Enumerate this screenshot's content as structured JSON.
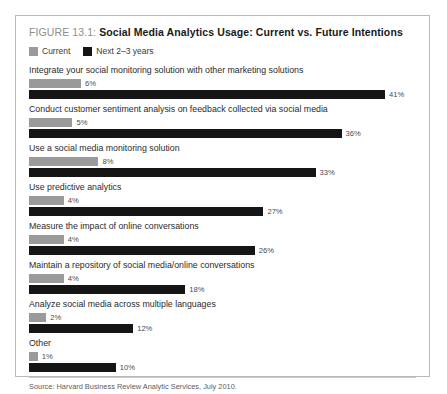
{
  "figure": {
    "prefix": "FIGURE 13.1:",
    "title": "Social Media Analytics Usage: Current vs. Future Intentions",
    "source": "Source: Harvard Business Review Analytic Services, July 2010."
  },
  "colors": {
    "current": "#9a9a9a",
    "future": "#151515",
    "border": "#b9b9b9",
    "label": "#2b2b2b",
    "value": "#4a4a4a",
    "prefix": "#8e8e8e"
  },
  "chart_data": {
    "type": "bar",
    "title": "Social Media Analytics Usage: Current vs. Future Intentions",
    "xlabel": "",
    "ylabel": "",
    "xlim": [
      0,
      44
    ],
    "grid": false,
    "orientation": "horizontal",
    "legend_position": "top-left",
    "value_suffix": "%",
    "categories": [
      "Integrate your social monitoring solution with other marketing solutions",
      "Conduct customer sentiment analysis on feedback collected via social media",
      "Use a social media monitoring solution",
      "Use predictive analytics",
      "Measure the impact of online conversations",
      "Maintain a repository of social media/online conversations",
      "Analyze social media across multiple languages",
      "Other"
    ],
    "series": [
      {
        "name": "Current",
        "color": "#9a9a9a",
        "values": [
          6,
          5,
          8,
          4,
          4,
          4,
          2,
          1
        ],
        "labels": [
          "6%",
          "5%",
          "8%",
          "4%",
          "4%",
          "4%",
          "2%",
          "1%"
        ]
      },
      {
        "name": "Next 2–3 years",
        "color": "#151515",
        "values": [
          41,
          36,
          33,
          27,
          26,
          18,
          12,
          10
        ],
        "labels": [
          "41%",
          "36%",
          "33%",
          "27%",
          "26%",
          "18%",
          "12%",
          "10%"
        ]
      }
    ]
  }
}
